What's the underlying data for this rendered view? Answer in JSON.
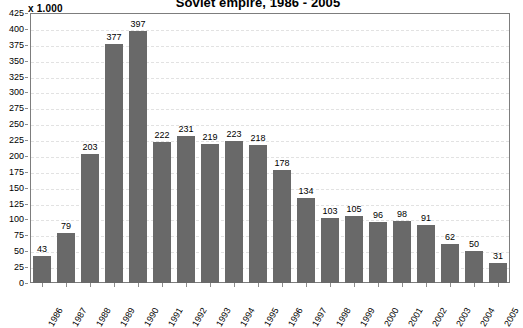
{
  "chart_data": {
    "type": "bar",
    "title": "Soviet empire, 1986 - 2005",
    "unit_caption": "x 1.000",
    "xlabel": "",
    "ylabel": "",
    "ylim": [
      0,
      425
    ],
    "ytick_step": 25,
    "grid": true,
    "legend": "none",
    "bar_color": "#696969",
    "categories": [
      "1986",
      "1987",
      "1988",
      "1989",
      "1990",
      "1991",
      "1992",
      "1993",
      "1994",
      "1995",
      "1996",
      "1997",
      "1998",
      "1999",
      "2000",
      "2001",
      "2002",
      "2003",
      "2004",
      "2005"
    ],
    "values": [
      43,
      79,
      203,
      377,
      397,
      222,
      231,
      219,
      223,
      218,
      178,
      134,
      103,
      105,
      96,
      98,
      91,
      62,
      50,
      31
    ],
    "ytick_labels": [
      "0",
      "25",
      "50",
      "75",
      "100",
      "125",
      "150",
      "175",
      "200",
      "225",
      "250",
      "275",
      "300",
      "325",
      "350",
      "375",
      "400",
      "425"
    ]
  }
}
